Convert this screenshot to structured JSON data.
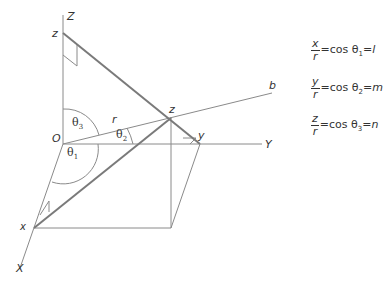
{
  "diagram": {
    "axes": {
      "Z": "Z",
      "Y": "Y",
      "X": "X",
      "origin": "O",
      "b": "b"
    },
    "points": {
      "z_top": "z",
      "z_point": "z",
      "y_point": "y",
      "x_point": "x"
    },
    "vector_label": "r",
    "angles": {
      "theta1": "θ",
      "theta1_sub": "1",
      "theta2": "θ",
      "theta2_sub": "2",
      "theta3": "θ",
      "theta3_sub": "3"
    },
    "colors": {
      "line": "#8a8a8a",
      "heavy": "#7a7a7a",
      "text": "#333333"
    }
  },
  "equations": [
    {
      "num": "x",
      "den": "r",
      "mid": "=cos θ",
      "sub": "1",
      "eq": "=",
      "rhs": "l"
    },
    {
      "num": "y",
      "den": "r",
      "mid": "=cos θ",
      "sub": "2",
      "eq": "=",
      "rhs": "m"
    },
    {
      "num": "z",
      "den": "r",
      "mid": "=cos θ",
      "sub": "3",
      "eq": "=",
      "rhs": "n"
    }
  ]
}
